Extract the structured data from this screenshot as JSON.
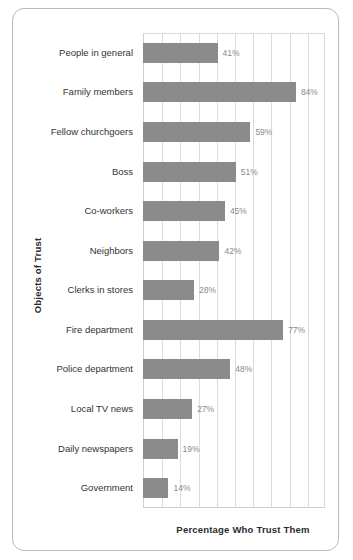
{
  "frame": {
    "border_color": "#b9b9b9"
  },
  "chart_data": {
    "type": "bar",
    "orientation": "horizontal",
    "title": "",
    "xlabel": "Percentage Who Trust Them",
    "ylabel": "Objects of Trust",
    "xlim": [
      0,
      100
    ],
    "xtick_step": 10,
    "xtick_labels_visible": false,
    "grid": true,
    "legend": null,
    "bar_color": "#8b8b8b",
    "value_label_color": "#8a8a8a",
    "value_label_suffix": "%",
    "categories": [
      "People in general",
      "Family members",
      "Fellow churchgoers",
      "Boss",
      "Co-workers",
      "Neighbors",
      "Clerks in stores",
      "Fire department",
      "Police department",
      "Local TV news",
      "Daily newspapers",
      "Government"
    ],
    "values": [
      41,
      84,
      59,
      51,
      45,
      42,
      28,
      77,
      48,
      27,
      19,
      14
    ],
    "value_labels": [
      "41%",
      "84%",
      "59%",
      "51%",
      "45%",
      "42%",
      "28%",
      "77%",
      "48%",
      "27%",
      "19%",
      "14%"
    ]
  }
}
